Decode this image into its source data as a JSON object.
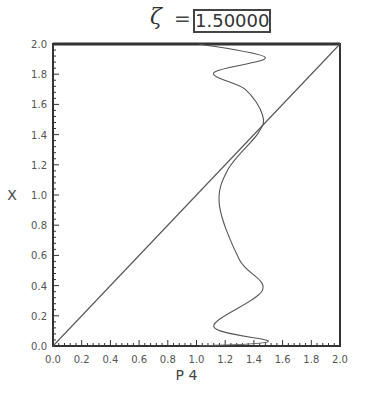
{
  "title": {
    "symbol": "ζ",
    "equals": "=",
    "value": "1.50000"
  },
  "chart_data": {
    "type": "line",
    "title": "ζ = 1.50000",
    "xlabel": "P 4",
    "ylabel": "X",
    "xlim": [
      0.0,
      2.0
    ],
    "ylim": [
      0.0,
      2.0
    ],
    "grid": false,
    "x_ticks": [
      "0.0",
      "0.2",
      "0.4",
      "0.6",
      "0.8",
      "1.0",
      "1.2",
      "1.4",
      "1.6",
      "1.8",
      "2.0"
    ],
    "y_ticks": [
      "0.0",
      "0.2",
      "0.4",
      "0.6",
      "0.8",
      "1.0",
      "1.2",
      "1.4",
      "1.6",
      "1.8",
      "2.0"
    ],
    "series": [
      {
        "name": "diagonal",
        "x": [
          0.0,
          2.0
        ],
        "y": [
          0.0,
          2.0
        ]
      },
      {
        "name": "curve",
        "x": [
          1.02,
          1.5,
          1.12,
          1.46,
          1.3,
          1.16,
          1.22,
          1.43,
          1.46,
          1.34,
          1.12,
          1.48,
          1.02
        ],
        "y": [
          0.0,
          0.03,
          0.13,
          0.37,
          0.57,
          0.93,
          1.17,
          1.41,
          1.53,
          1.7,
          1.81,
          1.91,
          2.0
        ]
      }
    ]
  },
  "colors": {
    "axis": "#333333",
    "line": "#555555",
    "text": "#444444"
  }
}
